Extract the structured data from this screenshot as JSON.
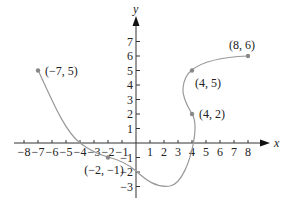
{
  "chart_data": {
    "type": "line",
    "title": "",
    "xlabel": "x",
    "ylabel": "y",
    "xlim": [
      -8,
      8
    ],
    "ylim": [
      -3,
      7
    ],
    "grid": false,
    "x_ticks": [
      -8,
      -7,
      -6,
      -5,
      -4,
      -3,
      -2,
      -1,
      1,
      2,
      3,
      4,
      5,
      6,
      7,
      8
    ],
    "y_ticks": [
      -3,
      -2,
      -1,
      1,
      2,
      3,
      4,
      5,
      6,
      7
    ],
    "x_tick_labels": [
      "−8",
      "−7",
      "−6",
      "−5",
      "−4",
      "−3",
      "−2",
      "−1",
      "1",
      "2",
      "3",
      "4",
      "5",
      "6",
      "7",
      "8"
    ],
    "y_tick_labels": [
      "−3",
      "−2",
      "−1",
      "1",
      "2",
      "3",
      "4",
      "5",
      "6",
      "7"
    ],
    "curve_color": "#999999",
    "axis_color": "#333333",
    "series": [
      {
        "name": "curve",
        "points": [
          {
            "x": -7,
            "y": 5
          },
          {
            "x": -4,
            "y": 0
          },
          {
            "x": -2,
            "y": -1
          },
          {
            "x": 0,
            "y": -2
          },
          {
            "x": 2,
            "y": -3
          },
          {
            "x": 4,
            "y": 0
          },
          {
            "x": 4,
            "y": 2
          },
          {
            "x": 3.3,
            "y": 3.5
          },
          {
            "x": 4,
            "y": 5
          },
          {
            "x": 8,
            "y": 6
          }
        ]
      }
    ],
    "labeled_points": [
      {
        "x": -7,
        "y": 5,
        "label": "(−7, 5)"
      },
      {
        "x": -2,
        "y": -1,
        "label": "(−2, −1)"
      },
      {
        "x": 4,
        "y": 2,
        "label": "(4, 2)"
      },
      {
        "x": 4,
        "y": 5,
        "label": "(4, 5)"
      },
      {
        "x": 8,
        "y": 6,
        "label": "(8, 6)"
      }
    ]
  }
}
